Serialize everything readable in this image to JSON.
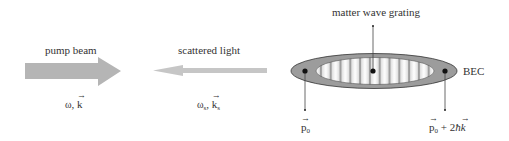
{
  "labels": {
    "pump_beam": "pump beam",
    "scattered_light": "scattered light",
    "matter_wave_grating": "matter wave grating",
    "bec": "BEC"
  },
  "pump_symbol": {
    "omega": "ω",
    "sep": ",",
    "k": "k"
  },
  "scattered_symbol": {
    "omega": "ω",
    "omega_sub": "s",
    "sep": ",",
    "k": "k",
    "k_sub": "s"
  },
  "momentum_left": {
    "p": "p",
    "sub": "0"
  },
  "momentum_right": {
    "p": "p",
    "sub": "0",
    "plus": " + 2",
    "hbar": "ħ",
    "k": "k"
  },
  "colors": {
    "pump_arrow": "#b3b3b3",
    "scattered_arrow": "#c4c4c4",
    "bec_outer": "#9a9a9a",
    "bec_inner_bg": "#ffffff",
    "fringe_dark": "#8a8a8a",
    "dot": "#111111",
    "line": "#333333"
  }
}
